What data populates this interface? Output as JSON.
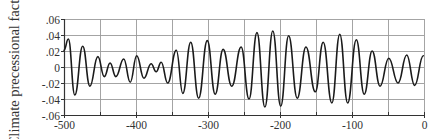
{
  "chart_data": {
    "type": "line",
    "title": "",
    "xlabel": "",
    "ylabel": "Climate precessional factor",
    "xlim": [
      -500,
      0
    ],
    "ylim": [
      -0.06,
      0.06
    ],
    "x_ticks": [
      -500,
      -400,
      -300,
      -200,
      -100,
      0
    ],
    "x_tick_labels": [
      "-500",
      "-400",
      "-300",
      "-200",
      "-100",
      "0"
    ],
    "x_minor_ticks": [
      -450,
      -350,
      -250,
      -150,
      -50
    ],
    "y_ticks": [
      0.06,
      0.04,
      0.02,
      0,
      -0.02,
      -0.04,
      -0.06
    ],
    "y_tick_labels": [
      ".06",
      ".04",
      ".02",
      "0",
      "-.02",
      "-.04",
      "-.06"
    ],
    "grid": true,
    "grid_x_step": 50,
    "grid_y_step": 0.02,
    "legend": null,
    "series": [
      {
        "name": "Climate precessional factor",
        "color": "#1a1a1a",
        "x": [
          -500,
          -494,
          -485,
          -474,
          -464,
          -453,
          -444,
          -436,
          -428,
          -417,
          -408,
          -399,
          -389,
          -379,
          -372,
          -365,
          -356,
          -344,
          -335,
          -324,
          -313,
          -301,
          -290,
          -279,
          -267,
          -254,
          -243,
          -232,
          -221,
          -210,
          -199,
          -188,
          -176,
          -164,
          -151,
          -140,
          -128,
          -117,
          -106,
          -94,
          -83,
          -72,
          -61,
          -49,
          -36,
          -24,
          -13,
          -1
        ],
        "values": [
          0.021,
          0.035,
          -0.035,
          0.026,
          -0.024,
          0.013,
          -0.012,
          0.005,
          -0.012,
          0.01,
          -0.019,
          0.014,
          -0.014,
          0.004,
          -0.006,
          0.006,
          -0.02,
          0.021,
          -0.033,
          0.031,
          -0.039,
          0.033,
          -0.034,
          0.022,
          -0.024,
          0.025,
          -0.04,
          0.043,
          -0.05,
          0.045,
          -0.049,
          0.039,
          -0.039,
          0.025,
          -0.031,
          0.031,
          -0.045,
          0.041,
          -0.045,
          0.034,
          -0.034,
          0.02,
          -0.024,
          0.011,
          -0.02,
          0.015,
          -0.023,
          0.014
        ]
      }
    ]
  },
  "colors": {
    "grid": "#9a9a9a",
    "axis": "#333333",
    "line": "#1a1a1a",
    "text": "#333333"
  }
}
